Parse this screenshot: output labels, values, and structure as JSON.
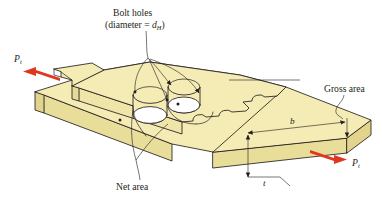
{
  "figure": {
    "name": "bolted-lap-splice-gross-and-net-area",
    "background_color": "#ffffff",
    "view": "isometric",
    "plate_fill_top": "#f4ecb4",
    "plate_fill_side": "#e9dd9a",
    "plate_fill_front": "#efe5a8",
    "hole_fill": "#ffffff",
    "outline_color": "#231f20",
    "arrow_color": "#e0381f"
  },
  "annotations": {
    "bolt_holes": {
      "line1": "Bolt holes",
      "line2_prefix": "(diameter = ",
      "line2_symbol": "d",
      "line2_subscript": "H",
      "line2_suffix": ")"
    },
    "net_area": "Net area",
    "gross_area": "Gross area"
  },
  "forces": {
    "left": {
      "symbol": "P",
      "subscript": "t",
      "direction": "left"
    },
    "right": {
      "symbol": "P",
      "subscript": "t",
      "direction": "right"
    }
  },
  "dimensions": {
    "width": {
      "symbol": "b",
      "description": "plate width"
    },
    "thickness": {
      "symbol": "t",
      "description": "plate thickness"
    }
  },
  "holes": {
    "count": 2,
    "labels": [
      "bolt-hole-1",
      "bolt-hole-2"
    ]
  }
}
